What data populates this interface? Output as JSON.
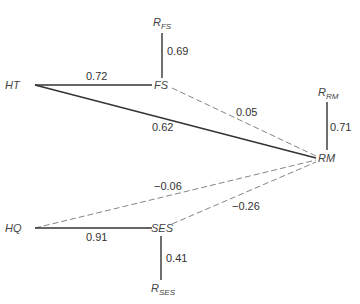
{
  "diagram": {
    "type": "path-diagram",
    "nodes": {
      "HT": {
        "label": "HT"
      },
      "FS": {
        "label": "FS"
      },
      "RM": {
        "label": "RM"
      },
      "HQ": {
        "label": "HQ"
      },
      "SES": {
        "label": "SES"
      },
      "R_FS": {
        "main": "R",
        "sub": "FS"
      },
      "R_RM": {
        "main": "R",
        "sub": "RM"
      },
      "R_SES": {
        "main": "R",
        "sub": "SES"
      }
    },
    "paths": [
      {
        "from": "HT",
        "to": "FS",
        "coef": "0.72",
        "style": "solid"
      },
      {
        "from": "HT",
        "to": "RM",
        "coef": "0.62",
        "style": "solid"
      },
      {
        "from": "FS",
        "to": "RM",
        "coef": "0.05",
        "style": "dashed"
      },
      {
        "from": "R_FS",
        "to": "FS",
        "coef": "0.69",
        "style": "solid"
      },
      {
        "from": "R_RM",
        "to": "RM",
        "coef": "0.71",
        "style": "solid"
      },
      {
        "from": "HQ",
        "to": "RM",
        "coef": "−0.06",
        "style": "dashed"
      },
      {
        "from": "SES",
        "to": "RM",
        "coef": "−0.26",
        "style": "dashed"
      },
      {
        "from": "HQ",
        "to": "SES",
        "coef": "0.91",
        "style": "solid"
      },
      {
        "from": "R_SES",
        "to": "SES",
        "coef": "0.41",
        "style": "solid"
      }
    ]
  }
}
